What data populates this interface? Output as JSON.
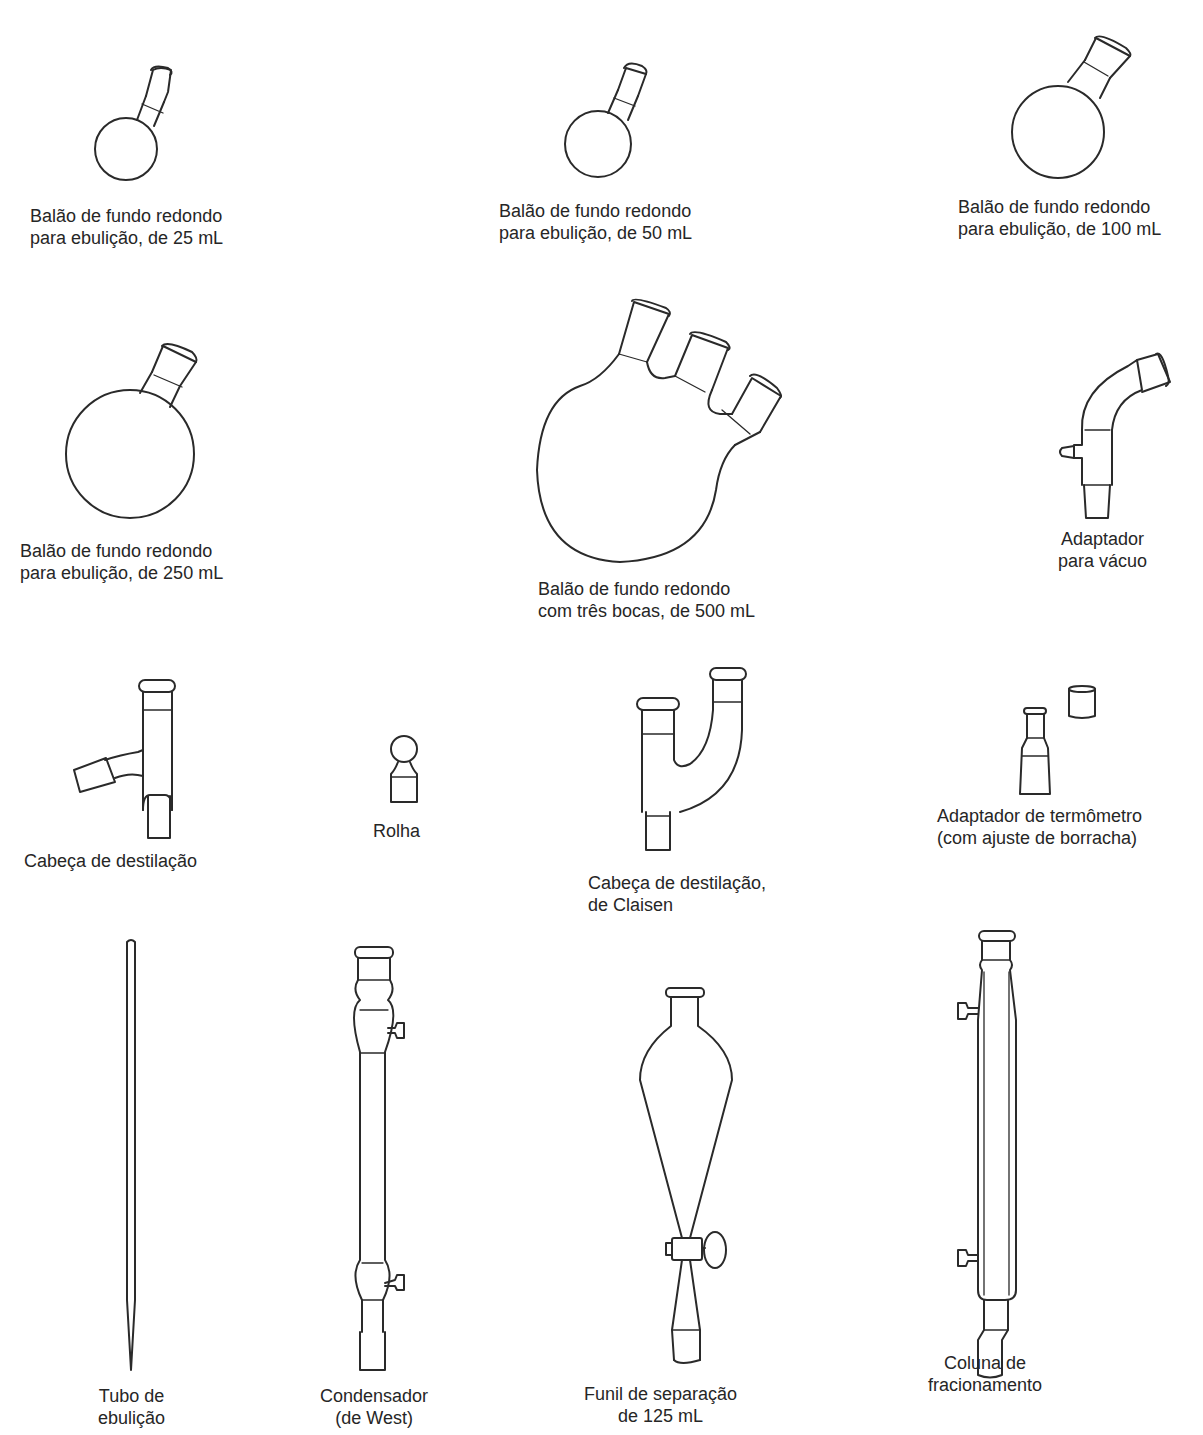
{
  "figure": {
    "items": [
      {
        "id": "flask-25",
        "icon": "round-bottom-flask-icon",
        "label_lines": [
          "Balão de fundo redondo",
          "para ebulição, de 25 mL"
        ]
      },
      {
        "id": "flask-50",
        "icon": "round-bottom-flask-icon",
        "label_lines": [
          "Balão de fundo redondo",
          "para ebulição, de 50 mL"
        ]
      },
      {
        "id": "flask-100",
        "icon": "round-bottom-flask-icon",
        "label_lines": [
          "Balão de fundo redondo",
          "para ebulição, de 100 mL"
        ]
      },
      {
        "id": "flask-250",
        "icon": "round-bottom-flask-icon",
        "label_lines": [
          "Balão de fundo redondo",
          "para ebulição, de 250 mL"
        ]
      },
      {
        "id": "flask-three-neck-500",
        "icon": "three-neck-flask-icon",
        "label_lines": [
          "Balão de fundo redondo",
          "com três bocas, de 500 mL"
        ]
      },
      {
        "id": "vacuum-adapter",
        "icon": "vacuum-adapter-icon",
        "label_lines": [
          "Adaptador",
          "para vácuo"
        ]
      },
      {
        "id": "distillation-head",
        "icon": "distillation-head-icon",
        "label_lines": [
          "Cabeça de destilação"
        ]
      },
      {
        "id": "stopper",
        "icon": "stopper-icon",
        "label_lines": [
          "Rolha"
        ]
      },
      {
        "id": "claisen-head",
        "icon": "claisen-head-icon",
        "label_lines": [
          "Cabeça de destilação,",
          "de Claisen"
        ]
      },
      {
        "id": "thermometer-adapter",
        "icon": "thermometer-adapter-icon",
        "label_lines": [
          "Adaptador de termômetro",
          "(com ajuste de borracha)"
        ]
      },
      {
        "id": "boiling-tube",
        "icon": "boiling-tube-icon",
        "label_lines": [
          "Tubo de",
          "ebulição"
        ]
      },
      {
        "id": "west-condenser",
        "icon": "condenser-icon",
        "label_lines": [
          "Condensador",
          "(de West)"
        ]
      },
      {
        "id": "separatory-funnel",
        "icon": "separatory-funnel-icon",
        "label_lines": [
          "Funil de separação",
          "de 125 mL"
        ]
      },
      {
        "id": "fractionating-column",
        "icon": "fractionating-column-icon",
        "label_lines": [
          "Coluna de",
          "fracionamento"
        ]
      }
    ]
  }
}
